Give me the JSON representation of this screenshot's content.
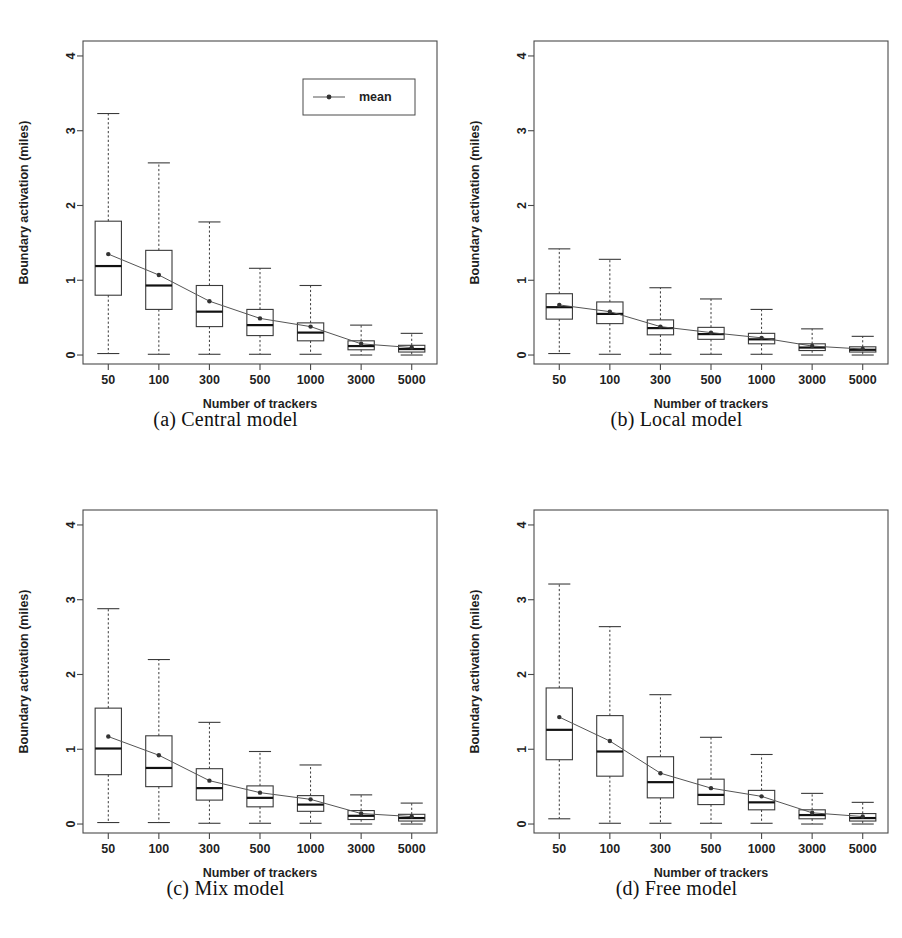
{
  "figure": {
    "panel_count": 4,
    "background_color": "#ffffff",
    "line_color": "#3a3a3a",
    "mean_marker_color": "#333333"
  },
  "chart_data": [
    {
      "type": "box",
      "panel_id": "a",
      "caption": "(a) Central model",
      "title": "",
      "xlabel": "Number of trackers",
      "ylabel": "Boundary activation (miles)",
      "categories": [
        "50",
        "100",
        "300",
        "500",
        "1000",
        "3000",
        "5000"
      ],
      "yticks": [
        0,
        1,
        2,
        3,
        4
      ],
      "ylim": [
        -0.12,
        4.2
      ],
      "grid": false,
      "legend": {
        "position": "top-right",
        "entries": [
          "mean"
        ]
      },
      "boxes": [
        {
          "category": "50",
          "whisker_low": 0.02,
          "q1": 0.8,
          "median": 1.19,
          "q3": 1.79,
          "whisker_high": 3.23,
          "mean": 1.35
        },
        {
          "category": "100",
          "whisker_low": 0.01,
          "q1": 0.61,
          "median": 0.93,
          "q3": 1.4,
          "whisker_high": 2.57,
          "mean": 1.07
        },
        {
          "category": "300",
          "whisker_low": 0.01,
          "q1": 0.38,
          "median": 0.58,
          "q3": 0.93,
          "whisker_high": 1.78,
          "mean": 0.72
        },
        {
          "category": "500",
          "whisker_low": 0.01,
          "q1": 0.26,
          "median": 0.4,
          "q3": 0.61,
          "whisker_high": 1.16,
          "mean": 0.49
        },
        {
          "category": "1000",
          "whisker_low": 0.01,
          "q1": 0.19,
          "median": 0.3,
          "q3": 0.43,
          "whisker_high": 0.93,
          "mean": 0.38
        },
        {
          "category": "3000",
          "whisker_low": 0.0,
          "q1": 0.07,
          "median": 0.12,
          "q3": 0.19,
          "whisker_high": 0.4,
          "mean": 0.15
        },
        {
          "category": "5000",
          "whisker_low": 0.0,
          "q1": 0.04,
          "median": 0.08,
          "q3": 0.13,
          "whisker_high": 0.29,
          "mean": 0.1
        }
      ]
    },
    {
      "type": "box",
      "panel_id": "b",
      "caption": "(b) Local model",
      "title": "",
      "xlabel": "Number of trackers",
      "ylabel": "Boundary activation (miles)",
      "categories": [
        "50",
        "100",
        "300",
        "500",
        "1000",
        "3000",
        "5000"
      ],
      "yticks": [
        0,
        1,
        2,
        3,
        4
      ],
      "ylim": [
        -0.12,
        4.2
      ],
      "grid": false,
      "legend": null,
      "boxes": [
        {
          "category": "50",
          "whisker_low": 0.02,
          "q1": 0.48,
          "median": 0.64,
          "q3": 0.82,
          "whisker_high": 1.42,
          "mean": 0.67
        },
        {
          "category": "100",
          "whisker_low": 0.01,
          "q1": 0.42,
          "median": 0.55,
          "q3": 0.71,
          "whisker_high": 1.28,
          "mean": 0.58
        },
        {
          "category": "300",
          "whisker_low": 0.01,
          "q1": 0.27,
          "median": 0.36,
          "q3": 0.47,
          "whisker_high": 0.9,
          "mean": 0.38
        },
        {
          "category": "500",
          "whisker_low": 0.01,
          "q1": 0.21,
          "median": 0.28,
          "q3": 0.37,
          "whisker_high": 0.75,
          "mean": 0.3
        },
        {
          "category": "1000",
          "whisker_low": 0.01,
          "q1": 0.15,
          "median": 0.21,
          "q3": 0.29,
          "whisker_high": 0.61,
          "mean": 0.23
        },
        {
          "category": "3000",
          "whisker_low": 0.0,
          "q1": 0.06,
          "median": 0.1,
          "q3": 0.15,
          "whisker_high": 0.35,
          "mean": 0.12
        },
        {
          "category": "5000",
          "whisker_low": 0.0,
          "q1": 0.04,
          "median": 0.07,
          "q3": 0.11,
          "whisker_high": 0.25,
          "mean": 0.08
        }
      ]
    },
    {
      "type": "box",
      "panel_id": "c",
      "caption": "(c) Mix model",
      "title": "",
      "xlabel": "Number of trackers",
      "ylabel": "Boundary activation (miles)",
      "categories": [
        "50",
        "100",
        "300",
        "500",
        "1000",
        "3000",
        "5000"
      ],
      "yticks": [
        0,
        1,
        2,
        3,
        4
      ],
      "ylim": [
        -0.12,
        4.2
      ],
      "grid": false,
      "legend": null,
      "boxes": [
        {
          "category": "50",
          "whisker_low": 0.02,
          "q1": 0.66,
          "median": 1.01,
          "q3": 1.55,
          "whisker_high": 2.88,
          "mean": 1.17
        },
        {
          "category": "100",
          "whisker_low": 0.02,
          "q1": 0.5,
          "median": 0.75,
          "q3": 1.18,
          "whisker_high": 2.2,
          "mean": 0.92
        },
        {
          "category": "300",
          "whisker_low": 0.01,
          "q1": 0.32,
          "median": 0.48,
          "q3": 0.74,
          "whisker_high": 1.36,
          "mean": 0.58
        },
        {
          "category": "500",
          "whisker_low": 0.01,
          "q1": 0.23,
          "median": 0.35,
          "q3": 0.51,
          "whisker_high": 0.97,
          "mean": 0.42
        },
        {
          "category": "1000",
          "whisker_low": 0.01,
          "q1": 0.17,
          "median": 0.26,
          "q3": 0.38,
          "whisker_high": 0.79,
          "mean": 0.33
        },
        {
          "category": "3000",
          "whisker_low": 0.0,
          "q1": 0.06,
          "median": 0.11,
          "q3": 0.18,
          "whisker_high": 0.39,
          "mean": 0.14
        },
        {
          "category": "5000",
          "whisker_low": 0.0,
          "q1": 0.04,
          "median": 0.08,
          "q3": 0.13,
          "whisker_high": 0.28,
          "mean": 0.1
        }
      ]
    },
    {
      "type": "box",
      "panel_id": "d",
      "caption": "(d) Free model",
      "title": "",
      "xlabel": "Number of trackers",
      "ylabel": "Boundary activation (miles)",
      "categories": [
        "50",
        "100",
        "300",
        "500",
        "1000",
        "3000",
        "5000"
      ],
      "yticks": [
        0,
        1,
        2,
        3,
        4
      ],
      "ylim": [
        -0.12,
        4.2
      ],
      "grid": false,
      "legend": null,
      "boxes": [
        {
          "category": "50",
          "whisker_low": 0.07,
          "q1": 0.86,
          "median": 1.26,
          "q3": 1.82,
          "whisker_high": 3.21,
          "mean": 1.43
        },
        {
          "category": "100",
          "whisker_low": 0.01,
          "q1": 0.64,
          "median": 0.97,
          "q3": 1.45,
          "whisker_high": 2.64,
          "mean": 1.11
        },
        {
          "category": "300",
          "whisker_low": 0.01,
          "q1": 0.35,
          "median": 0.56,
          "q3": 0.9,
          "whisker_high": 1.73,
          "mean": 0.68
        },
        {
          "category": "500",
          "whisker_low": 0.01,
          "q1": 0.26,
          "median": 0.39,
          "q3": 0.6,
          "whisker_high": 1.16,
          "mean": 0.48
        },
        {
          "category": "1000",
          "whisker_low": 0.01,
          "q1": 0.19,
          "median": 0.29,
          "q3": 0.45,
          "whisker_high": 0.93,
          "mean": 0.37
        },
        {
          "category": "3000",
          "whisker_low": 0.0,
          "q1": 0.07,
          "median": 0.12,
          "q3": 0.19,
          "whisker_high": 0.41,
          "mean": 0.15
        },
        {
          "category": "5000",
          "whisker_low": 0.0,
          "q1": 0.04,
          "median": 0.08,
          "q3": 0.14,
          "whisker_high": 0.29,
          "mean": 0.1
        }
      ]
    }
  ]
}
